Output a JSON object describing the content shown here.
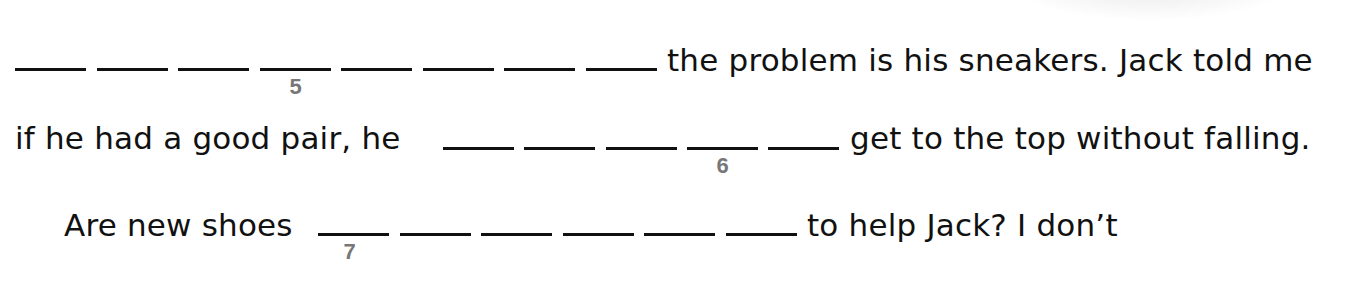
{
  "worksheet": {
    "lines": [
      {
        "blank_count": 8,
        "numbered_blank_index": 4,
        "number_label": "5",
        "text_after": "the problem is his sneakers. Jack told me"
      },
      {
        "text_before": "if he had a good pair, he",
        "blank_count": 5,
        "numbered_blank_index": 4,
        "number_label": "6",
        "text_after": "get to the top without falling."
      },
      {
        "text_before": "Are new shoes",
        "blank_count": 6,
        "numbered_blank_index": 1,
        "number_label": "7",
        "text_after": "to help Jack? I don’t"
      }
    ]
  }
}
